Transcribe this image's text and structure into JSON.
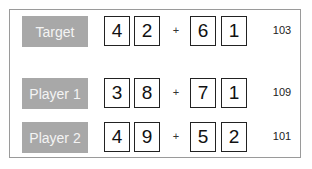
{
  "rows": [
    {
      "label": "Target",
      "digits": [
        "4",
        "2",
        "6",
        "1"
      ],
      "operator": "+",
      "result": "103"
    },
    {
      "label": "Player 1",
      "digits": [
        "3",
        "8",
        "7",
        "1"
      ],
      "operator": "+",
      "result": "109"
    },
    {
      "label": "Player 2",
      "digits": [
        "4",
        "9",
        "5",
        "2"
      ],
      "operator": "+",
      "result": "101"
    }
  ],
  "colors": {
    "label_bg": "#a8a8a8",
    "label_text": "#f4f4f4",
    "frame_border": "#9a9a9a",
    "digit_border": "#222222"
  }
}
